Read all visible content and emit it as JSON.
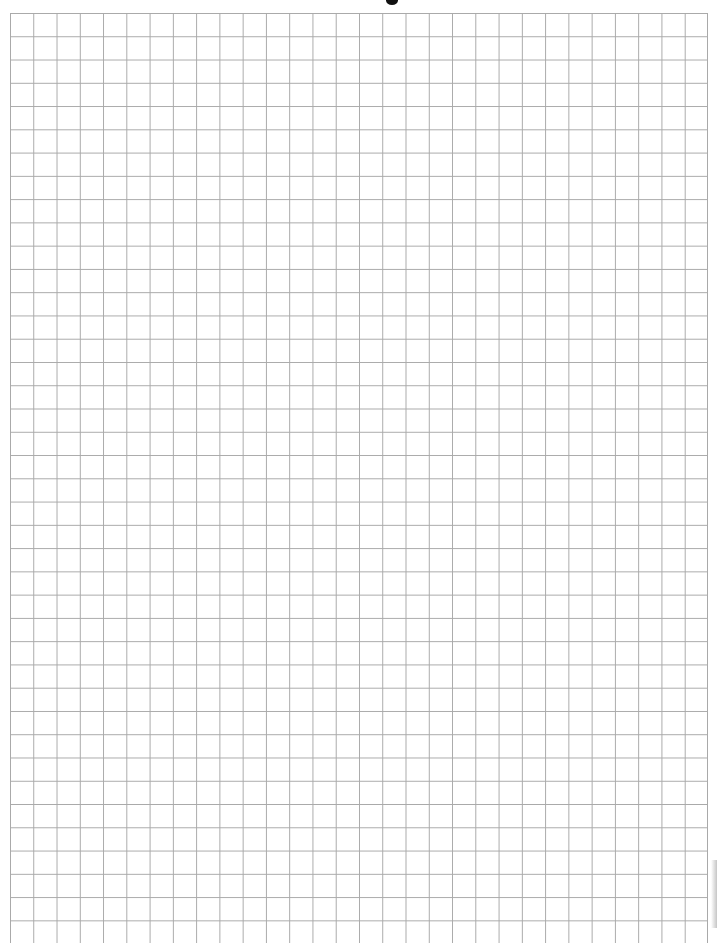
{
  "document": {
    "type": "graph-paper-sheet",
    "grid": {
      "columns": 30,
      "visible_rows": 39,
      "cell_size_px": 23.27,
      "line_color": "#a9a9a9",
      "background_color": "#ffffff"
    },
    "marks": {
      "top_punch_mark_color": "#111111"
    }
  }
}
